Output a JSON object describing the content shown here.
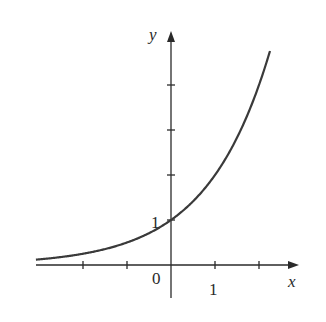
{
  "chart_data": {
    "type": "line",
    "title": "",
    "function": "y = 2^x",
    "xlabel": "x",
    "ylabel": "y",
    "xlim": [
      -3.08,
      2.9
    ],
    "ylim": [
      -0.7,
      5.3
    ],
    "x_ticks": [
      -2,
      -1,
      1,
      2
    ],
    "y_ticks": [
      1,
      2,
      3,
      4
    ],
    "tick_labels": {
      "origin": "0",
      "x_one": "1",
      "y_one": "1"
    },
    "grid": false,
    "legend": null,
    "series": [
      {
        "name": "y = 2^x",
        "x": [
          -3.07,
          -2,
          -1.5,
          -1,
          -0.5,
          0,
          0.5,
          1,
          1.5,
          2,
          2.25
        ],
        "values": [
          0.12,
          0.25,
          0.35,
          0.5,
          0.71,
          1,
          1.41,
          2,
          2.83,
          4,
          4.76
        ]
      }
    ],
    "annotations": [
      "y-intercept at (0, 1)"
    ]
  },
  "colors": {
    "axis": "#2a2a2a",
    "curve": "#3a3a3a",
    "background": "#ffffff"
  }
}
